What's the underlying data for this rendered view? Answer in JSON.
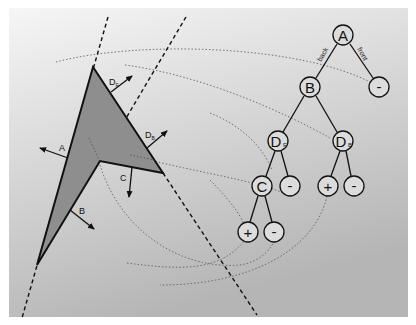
{
  "figure": {
    "colors": {
      "background_top": "#f4f4f4",
      "background_bottom": "#b9b9b9",
      "polygon_fill": "#8e8e8e",
      "stroke": "#111111",
      "node_fill": "#dcdcdc"
    },
    "polygon": {
      "edge_labels": {
        "A": "A",
        "B": "B",
        "C": "C",
        "D_front": "D",
        "D_back": "D",
        "D_front_sub": "F",
        "D_back_sub": "B"
      }
    },
    "tree": {
      "edge_labels": {
        "back": "back",
        "front": "front"
      },
      "nodes": [
        {
          "id": "A",
          "label": "A",
          "sub": ""
        },
        {
          "id": "B",
          "label": "B",
          "sub": ""
        },
        {
          "id": "A_front",
          "label": "-",
          "sub": ""
        },
        {
          "id": "DF",
          "label": "D",
          "sub": "F"
        },
        {
          "id": "DB",
          "label": "D",
          "sub": "B"
        },
        {
          "id": "C",
          "label": "C",
          "sub": ""
        },
        {
          "id": "DF_front",
          "label": "-",
          "sub": ""
        },
        {
          "id": "DB_back",
          "label": "+",
          "sub": ""
        },
        {
          "id": "DB_front",
          "label": "-",
          "sub": ""
        },
        {
          "id": "C_back",
          "label": "+",
          "sub": ""
        },
        {
          "id": "C_front",
          "label": "-",
          "sub": ""
        }
      ]
    }
  }
}
